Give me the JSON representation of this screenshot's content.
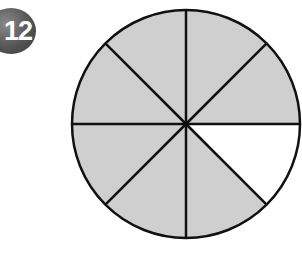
{
  "problem": {
    "number": "12"
  },
  "diagram": {
    "type": "fraction-circle",
    "total_parts": 8,
    "shaded_parts": 7,
    "unshaded_part_index": 7,
    "colors": {
      "shaded": "#cfcfcf",
      "unshaded": "#ffffff",
      "stroke": "#111111",
      "badge": "#555555"
    }
  }
}
